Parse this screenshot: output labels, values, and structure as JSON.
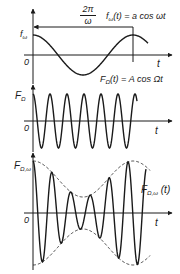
{
  "figure": {
    "panel1": {
      "y_label": "f",
      "y_label_sub": "ω",
      "origin_label": "0",
      "x_label": "t",
      "equation": "fω(t) = a cos ωt",
      "equation_parts": {
        "f": "f",
        "sub": "ω",
        "rest": "(t) = a cos ωt"
      },
      "period_num": "2π",
      "period_den": "ω"
    },
    "panel2": {
      "y_label": "F",
      "y_label_sub": "Ω",
      "origin_label": "0",
      "x_label": "t",
      "equation_parts": {
        "f": "F",
        "sub": "Ω",
        "rest": "(t) = A cos Ωt"
      }
    },
    "panel3": {
      "y_label": "F",
      "y_label_sub": "Ω,ω",
      "origin_label": "0",
      "x_label": "t",
      "curve_label_parts": {
        "f": "F",
        "sub": "Ω,ω",
        "rest": " (t)"
      }
    }
  },
  "colors": {
    "line": "#1a1a1a",
    "background": "#ffffff"
  },
  "waves": {
    "panel1": {
      "type": "cosine",
      "cycles": 1.15,
      "x0": 33,
      "x1": 148,
      "period_px": 100,
      "amplitude_px": 20,
      "baseline_y": 55
    },
    "panel2": {
      "type": "cosine",
      "cycles": 6.2,
      "x0": 33,
      "x1": 137,
      "period_px": 17,
      "amplitude_px": 27,
      "baseline_y": 121
    },
    "panel3": {
      "type": "modulated",
      "x0": 33,
      "x1": 146,
      "carrier_period_px": 19,
      "baseline_y": 213,
      "envelope_min": 16,
      "envelope_max": 52
    }
  }
}
